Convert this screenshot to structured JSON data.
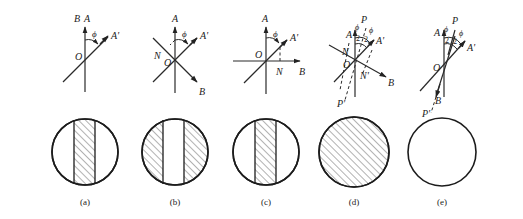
{
  "figure": {
    "panels": [
      {
        "id": "a",
        "caption": "(a)",
        "axis_labels": {
          "top": "A",
          "top_left": "B",
          "rotated": "A'",
          "origin": "O",
          "angle": "ϕ"
        },
        "field_pattern": "center-band-hatched"
      },
      {
        "id": "b",
        "caption": "(b)",
        "axis_labels": {
          "top": "A",
          "rotated": "A'",
          "origin": "O",
          "normal": "N",
          "bottom_right": "B",
          "angle": "ϕ"
        },
        "field_pattern": "sides-hatched"
      },
      {
        "id": "c",
        "caption": "(c)",
        "axis_labels": {
          "top": "A",
          "rotated": "A'",
          "origin": "O",
          "normal": "N",
          "right": "B",
          "angle": "ϕ"
        },
        "field_pattern": "center-band-hatched"
      },
      {
        "id": "d",
        "caption": "(d)",
        "axis_labels": {
          "top": "A",
          "rotated": "A'",
          "origin": "O",
          "normal": "N",
          "normal_prime": "N'",
          "bisector": "P",
          "bisector_prime": "P'",
          "right": "B",
          "angle": "ϕ",
          "half": "2"
        },
        "field_pattern": "fully-hatched"
      },
      {
        "id": "e",
        "caption": "(e)",
        "axis_labels": {
          "top": "A",
          "rotated": "A'",
          "origin": "O",
          "bisector": "P",
          "bisector_prime": "P'",
          "bottom": "B",
          "angle": "ϕ",
          "half": "2"
        },
        "field_pattern": "clear"
      }
    ]
  },
  "colors": {
    "ink": "#222222",
    "background": "#ffffff",
    "hatch": "#555555"
  }
}
